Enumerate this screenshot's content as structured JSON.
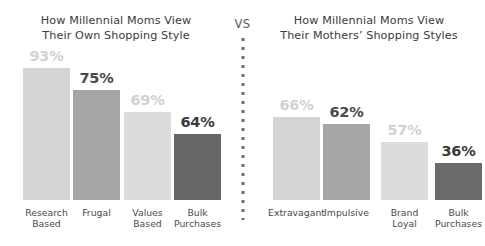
{
  "divider": {
    "label": "VS",
    "dots_icon": "vertical-dotted-divider"
  },
  "panels": [
    {
      "id": "own-shopping-style",
      "title": "How Millennial Moms View\nTheir Own Shopping Style",
      "bars": [
        {
          "label": "Research\nBased",
          "value": "93%",
          "number": 93,
          "color": "#d5d5d5",
          "label_color": "#d2d2d2",
          "bar_height_px": 132
        },
        {
          "label": "Frugal",
          "value": "75%",
          "number": 75,
          "color": "#a6a6a6",
          "label_color": "#4a4a4a",
          "bar_height_px": 110
        },
        {
          "label": "Values\nBased",
          "value": "69%",
          "number": 69,
          "color": "#dcdcdc",
          "label_color": "#d2d2d2",
          "bar_height_px": 88
        },
        {
          "label": "Bulk\nPurchases",
          "value": "64%",
          "number": 64,
          "color": "#666666",
          "label_color": "#3a3a3a",
          "bar_height_px": 66
        }
      ]
    },
    {
      "id": "mothers-shopping-styles",
      "title": "How Millennial Moms View\nTheir Mothers’ Shopping Styles",
      "bars": [
        {
          "label": "Extravagant",
          "value": "66%",
          "number": 66,
          "color": "#d5d5d5",
          "label_color": "#d2d2d2",
          "bar_height_px": 83
        },
        {
          "label": "Impulsive",
          "value": "62%",
          "number": 62,
          "color": "#a6a6a6",
          "label_color": "#4a4a4a",
          "bar_height_px": 76
        },
        {
          "label": "Brand\nLoyal",
          "value": "57%",
          "number": 57,
          "color": "#dcdcdc",
          "label_color": "#d2d2d2",
          "bar_height_px": 58
        },
        {
          "label": "Bulk\nPurchases",
          "value": "36%",
          "number": 36,
          "color": "#6b6b6b",
          "label_color": "#3a3a3a",
          "bar_height_px": 37
        }
      ]
    }
  ],
  "chart_data": {
    "type": "bar",
    "xlabel": "",
    "ylabel": "",
    "ylim": [
      0,
      100
    ],
    "grid": false,
    "legend": "none",
    "note": "Bar heights are stylized and not strictly proportional to the percentage values.",
    "panels": [
      {
        "title": "How Millennial Moms View Their Own Shopping Style",
        "categories": [
          "Research Based",
          "Frugal",
          "Values Based",
          "Bulk Purchases"
        ],
        "values": [
          93,
          75,
          69,
          64
        ],
        "value_labels": [
          "93%",
          "75%",
          "69%",
          "64%"
        ]
      },
      {
        "title": "How Millennial Moms View Their Mothers' Shopping Styles",
        "categories": [
          "Extravagant",
          "Impulsive",
          "Brand Loyal",
          "Bulk Purchases"
        ],
        "values": [
          66,
          62,
          57,
          36
        ],
        "value_labels": [
          "66%",
          "62%",
          "57%",
          "36%"
        ]
      }
    ]
  }
}
